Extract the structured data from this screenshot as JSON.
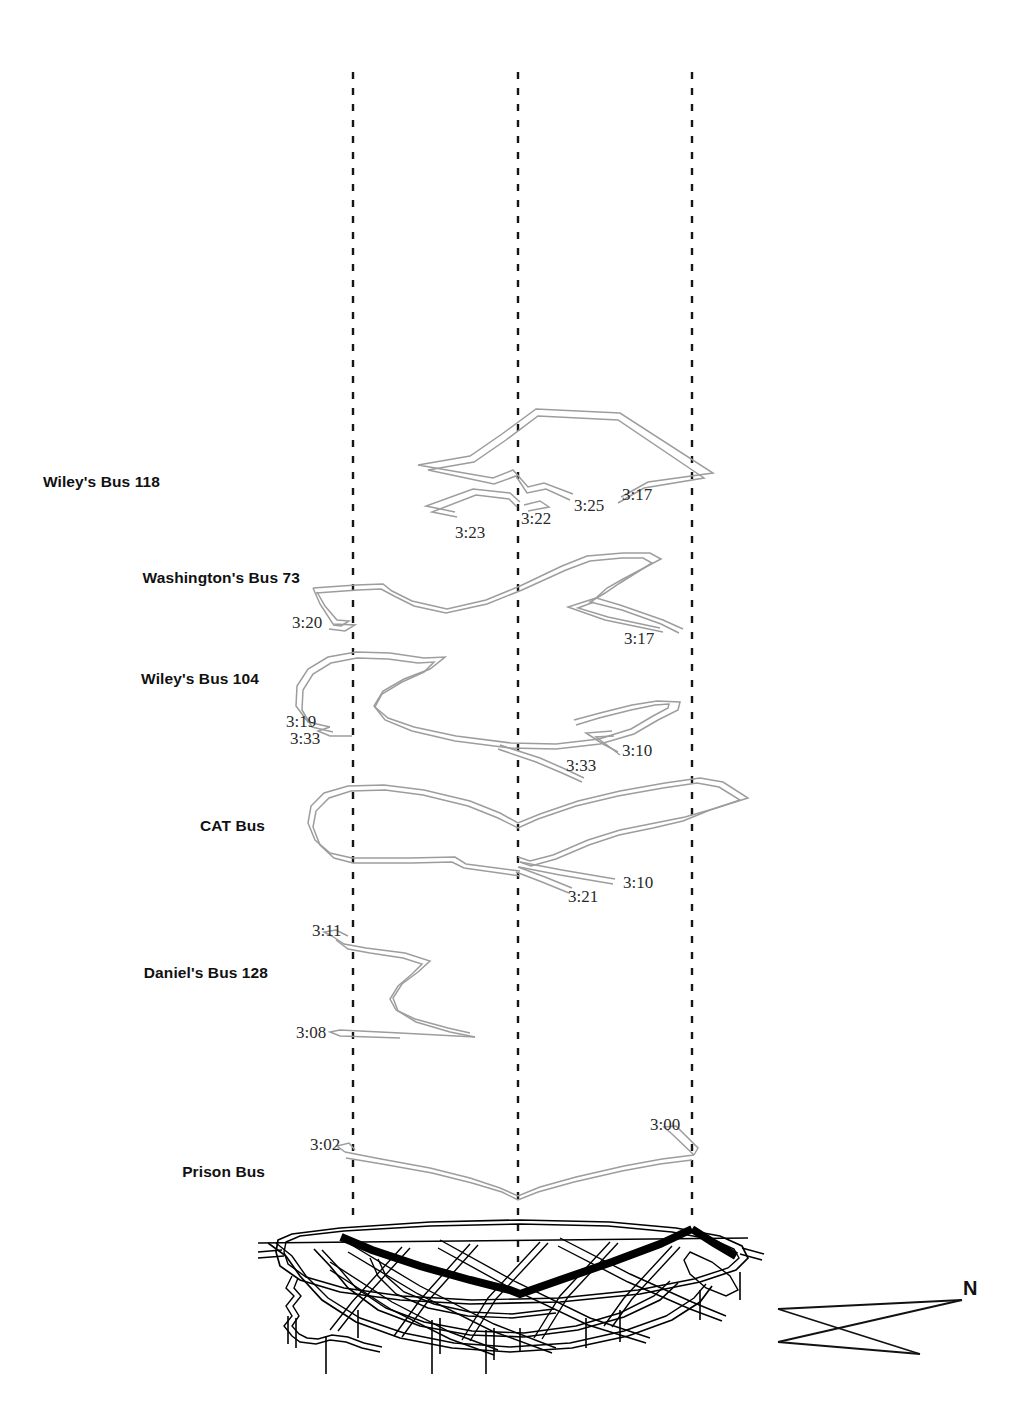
{
  "figure": {
    "type": "space-time-cube-map",
    "background_color": "#ffffff",
    "trajectory_color": "#9a9a9a",
    "basemap_color": "#000000",
    "highlight_route_color": "#000000",
    "timeline_color": "#1a1a1a"
  },
  "compass": {
    "north_label": "N"
  },
  "timelines": [
    {
      "name": "timeline-left",
      "x": 353,
      "y_top": 72,
      "y_bottom": 1224
    },
    {
      "name": "timeline-center",
      "x": 518,
      "y_top": 72,
      "y_bottom": 1260
    },
    {
      "name": "timeline-right",
      "x": 692,
      "y_top": 72,
      "y_bottom": 1222
    }
  ],
  "layers": [
    {
      "id": "wileys-bus-118",
      "label": "Wiley's Bus 118",
      "label_x": 160,
      "label_y": 482,
      "times": [
        {
          "value": "3:23",
          "x": 455,
          "y": 523
        },
        {
          "value": "3:22",
          "x": 521,
          "y": 509
        },
        {
          "value": "3:25",
          "x": 574,
          "y": 496
        },
        {
          "value": "3:17",
          "x": 622,
          "y": 485
        }
      ]
    },
    {
      "id": "washingtons-bus-73",
      "label": "Washington's Bus 73",
      "label_x": 74,
      "label_y": 578,
      "times": [
        {
          "value": "3:20",
          "x": 292,
          "y": 613
        },
        {
          "value": "3:17",
          "x": 624,
          "y": 629
        }
      ]
    },
    {
      "id": "wileys-bus-104",
      "label": "Wiley's Bus 104",
      "label_x": 105,
      "label_y": 679,
      "times": [
        {
          "value": "3:19",
          "x": 286,
          "y": 712
        },
        {
          "value": "3:33",
          "x": 290,
          "y": 729
        },
        {
          "value": "3:33",
          "x": 566,
          "y": 756
        },
        {
          "value": "3:10",
          "x": 622,
          "y": 741
        }
      ]
    },
    {
      "id": "cat-bus",
      "label": "CAT Bus",
      "label_x": 193,
      "label_y": 826,
      "times": [
        {
          "value": "3:21",
          "x": 568,
          "y": 887
        },
        {
          "value": "3:10",
          "x": 623,
          "y": 873
        }
      ]
    },
    {
      "id": "daniels-bus-128",
      "label": "Daniel's Bus 128",
      "label_x": 110,
      "label_y": 973,
      "times": [
        {
          "value": "3:11",
          "x": 312,
          "y": 921
        },
        {
          "value": "3:08",
          "x": 296,
          "y": 1023
        }
      ]
    },
    {
      "id": "prison-bus",
      "label": "Prison Bus",
      "label_x": 175,
      "label_y": 1172,
      "times": [
        {
          "value": "3:02",
          "x": 310,
          "y": 1135
        },
        {
          "value": "3:00",
          "x": 650,
          "y": 1115
        }
      ]
    }
  ]
}
